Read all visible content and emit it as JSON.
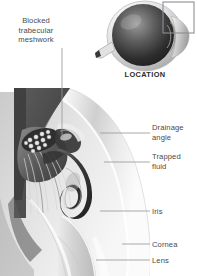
{
  "figure": {
    "title_overlay": "LOCATION",
    "background_color": "#ffffff",
    "label_color": "#4a4a4a"
  },
  "labels": {
    "blocked_trabecular_meshwork": "Blocked\ntrabecular\nmeshwork",
    "location": "LOCATION",
    "drainage_angle": "Drainage\nangle",
    "trapped_fluid": "Trapped\nfluid",
    "iris": "Iris",
    "cornea": "Cornea",
    "lens": "Lens"
  },
  "inset": {
    "name": "eye-globe-inset",
    "caption": "LOCATION",
    "highlight_box": "upper-right-quadrant"
  },
  "cross_section": {
    "name": "anterior-chamber-angle-cross-section",
    "structures": [
      "sclera",
      "ciliary-body",
      "trabecular-meshwork",
      "schlemm-canal",
      "drainage-angle",
      "iris",
      "cornea",
      "lens",
      "trapped-aqueous-fluid"
    ]
  },
  "colors": {
    "dark_tissue": "#3b3b3b",
    "mid_tissue": "#7d7d7d",
    "light_tissue": "#d8d8d8",
    "highlight": "#f2f2f2",
    "leader_line": "#9a9a9a",
    "inset_dark": "#2a2a2a"
  }
}
